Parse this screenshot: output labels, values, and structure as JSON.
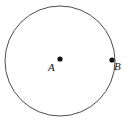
{
  "figure": {
    "type": "geometry-diagram",
    "background_color": "#ffffff",
    "width": 129,
    "height": 124
  },
  "circle": {
    "name": "circle-outline",
    "center_x": 60,
    "center_y": 61,
    "radius": 55,
    "stroke_color": "#4d4d4d",
    "stroke_width": 1,
    "fill": "none"
  },
  "points": [
    {
      "id": "A",
      "label": "A",
      "role": "center",
      "x": 60,
      "y": 59,
      "dot_radius": 2.6,
      "color": "#111111",
      "label_x": 48,
      "label_y": 62
    },
    {
      "id": "B",
      "label": "B",
      "role": "on-circumference",
      "x": 112,
      "y": 60,
      "dot_radius": 2.6,
      "color": "#111111",
      "label_x": 114,
      "label_y": 61
    }
  ]
}
